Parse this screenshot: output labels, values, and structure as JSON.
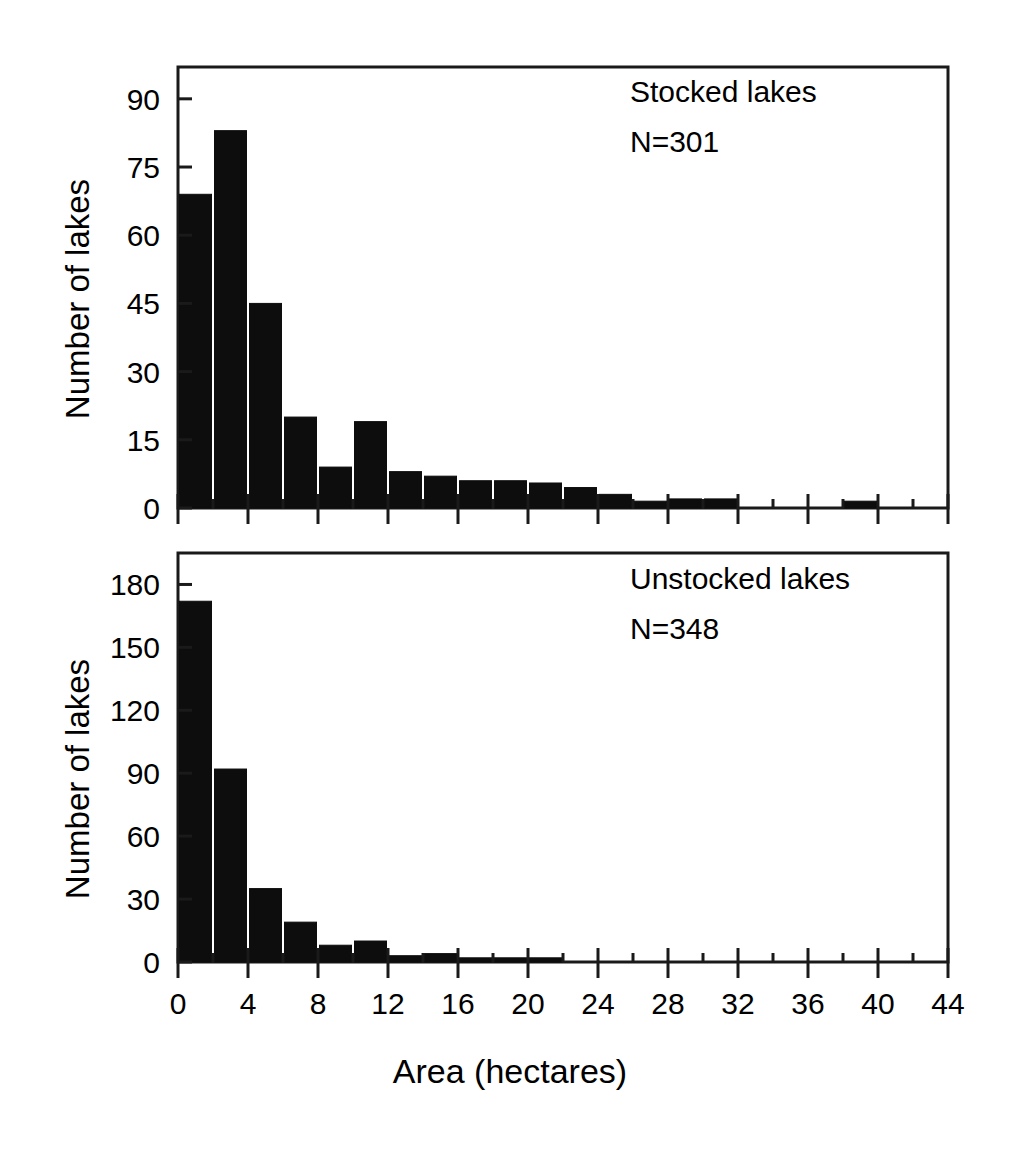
{
  "figure": {
    "xlabel": "Area (hectares)",
    "ylabel": "Number of lakes"
  },
  "panels": {
    "top": {
      "annotation_title": "Stocked lakes",
      "annotation_n": "N=301"
    },
    "bottom": {
      "annotation_title": "Unstocked lakes",
      "annotation_n": "N=348"
    }
  },
  "axis": {
    "x_ticks": [
      "0",
      "4",
      "8",
      "12",
      "16",
      "20",
      "24",
      "28",
      "32",
      "36",
      "40",
      "44"
    ],
    "y_ticks_top": [
      "0",
      "15",
      "30",
      "45",
      "60",
      "75",
      "90"
    ],
    "y_ticks_bottom": [
      "0",
      "30",
      "60",
      "90",
      "120",
      "150",
      "180"
    ]
  },
  "chart_data": [
    {
      "type": "bar",
      "title": "Stocked lakes",
      "annotation": "N=301",
      "xlabel": "Area (hectares)",
      "ylabel": "Number of lakes",
      "bin_width": 2,
      "xlim": [
        0,
        44
      ],
      "ylim": [
        0,
        97
      ],
      "grid": false,
      "legend": "none",
      "xticks": [
        0,
        4,
        8,
        12,
        16,
        20,
        24,
        28,
        32,
        36,
        40,
        44
      ],
      "xminor_step": 2,
      "yticks": [
        0,
        15,
        30,
        45,
        60,
        75,
        90
      ],
      "bin_starts": [
        0,
        2,
        4,
        6,
        8,
        10,
        12,
        14,
        16,
        18,
        20,
        22,
        24,
        26,
        28,
        30,
        32,
        34,
        36,
        38,
        40,
        42
      ],
      "values": [
        69,
        83,
        45,
        20,
        9,
        19,
        8,
        7,
        6,
        6,
        5.5,
        4.5,
        3,
        1.5,
        2,
        2,
        0,
        0,
        0,
        1.5,
        0,
        0
      ]
    },
    {
      "type": "bar",
      "title": "Unstocked lakes",
      "annotation": "N=348",
      "xlabel": "Area (hectares)",
      "ylabel": "Number of lakes",
      "bin_width": 2,
      "xlim": [
        0,
        44
      ],
      "ylim": [
        0,
        195
      ],
      "grid": false,
      "legend": "none",
      "xticks": [
        0,
        4,
        8,
        12,
        16,
        20,
        24,
        28,
        32,
        36,
        40,
        44
      ],
      "xminor_step": 2,
      "yticks": [
        0,
        30,
        60,
        90,
        120,
        150,
        180
      ],
      "bin_starts": [
        0,
        2,
        4,
        6,
        8,
        10,
        12,
        14,
        16,
        18,
        20,
        22,
        24,
        26,
        28,
        30,
        32,
        34,
        36,
        38,
        40,
        42
      ],
      "values": [
        172,
        92,
        35,
        19,
        8,
        10,
        3,
        4,
        2,
        2,
        2,
        0,
        0,
        0,
        0,
        0,
        0,
        0,
        0,
        0,
        0,
        0
      ]
    }
  ],
  "colors": {
    "bar": "#0d0d0d",
    "axis": "#1a1a1a",
    "background": "#ffffff"
  }
}
